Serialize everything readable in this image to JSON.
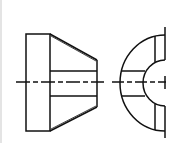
{
  "diagram": {
    "title": "",
    "colors": {
      "stroke": "#111111",
      "background": "#ffffff",
      "border": "#e4e4e4"
    },
    "views": [
      {
        "name": "side-view",
        "label": ""
      },
      {
        "name": "end-view",
        "label": ""
      }
    ]
  }
}
